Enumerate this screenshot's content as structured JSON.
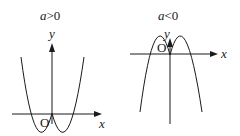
{
  "graphs": [
    {
      "condition_var": "a",
      "condition_op": ">0",
      "y_label": "y",
      "x_label": "x",
      "origin_label": "O",
      "opens": "up"
    },
    {
      "condition_var": "a",
      "condition_op": "<0",
      "y_label": "y",
      "x_label": "x",
      "origin_label": "O",
      "opens": "down"
    }
  ],
  "colors": {
    "stroke": "#1a1a1a"
  }
}
